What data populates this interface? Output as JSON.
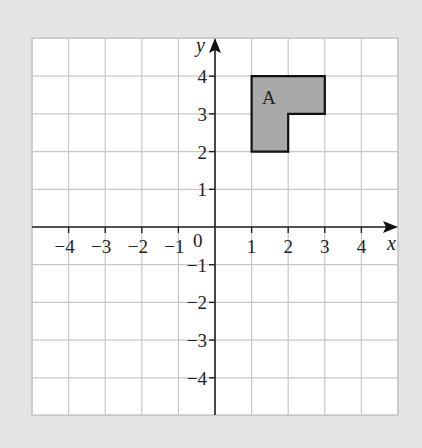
{
  "diagram": {
    "type": "coordinate-grid",
    "x_axis": {
      "label": "x",
      "min": -5,
      "max": 5,
      "tick_labels": [
        "−4",
        "−3",
        "−2",
        "−1",
        "1",
        "2",
        "3",
        "4"
      ],
      "tick_values": [
        -4,
        -3,
        -2,
        -1,
        1,
        2,
        3,
        4
      ]
    },
    "y_axis": {
      "label": "y",
      "min": -5,
      "max": 5,
      "tick_labels": [
        "4",
        "3",
        "2",
        "1",
        "−1",
        "−2",
        "−3",
        "−4"
      ],
      "tick_values": [
        4,
        3,
        2,
        1,
        -1,
        -2,
        -3,
        -4
      ]
    },
    "origin_label": "0",
    "shape": {
      "label": "A",
      "vertices": [
        [
          1,
          2
        ],
        [
          2,
          2
        ],
        [
          2,
          3
        ],
        [
          3,
          3
        ],
        [
          3,
          4
        ],
        [
          1,
          4
        ]
      ],
      "fill": "#a9a9a9",
      "stroke": "#111111"
    },
    "colors": {
      "background": "#e4e4e4",
      "grid_paper": "#ffffff",
      "grid_line": "#c4c4c4",
      "axis": "#222222"
    }
  }
}
